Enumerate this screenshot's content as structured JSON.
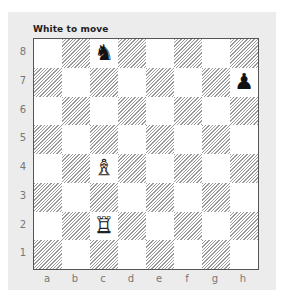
{
  "title": "White to move",
  "ranks": [
    "8",
    "7",
    "6",
    "5",
    "4",
    "3",
    "2",
    "1"
  ],
  "files": [
    "a",
    "b",
    "c",
    "d",
    "e",
    "f",
    "g",
    "h"
  ],
  "colors": {
    "panel": "#ececec",
    "dark_square_hatch": "#9a9a9a",
    "light_square": "#ffffff",
    "board_border": "#555555",
    "coord_text": "#777777"
  },
  "pieces": [
    {
      "square": "c8",
      "type": "knight",
      "color": "black",
      "glyph": "♞"
    },
    {
      "square": "h7",
      "type": "pawn",
      "color": "black",
      "glyph": "♟"
    },
    {
      "square": "c4",
      "type": "bishop",
      "color": "white",
      "glyph": "♗"
    },
    {
      "square": "c2",
      "type": "rook",
      "color": "white",
      "glyph": "♖"
    }
  ]
}
